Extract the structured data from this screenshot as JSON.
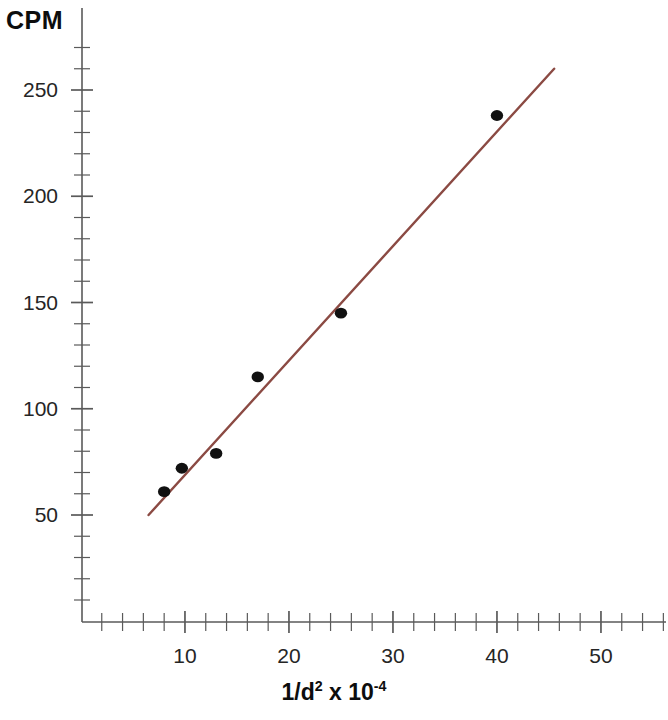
{
  "chart_data": {
    "type": "scatter",
    "title": "",
    "xlabel": "1/d² x 10⁻⁴",
    "ylabel": "CPM",
    "xlim": [
      0,
      57
    ],
    "ylim": [
      0,
      280
    ],
    "grid": false,
    "legend": null,
    "x": [
      8,
      9.7,
      13,
      17,
      25,
      40
    ],
    "y": [
      61,
      72,
      79,
      115,
      145,
      238
    ],
    "points": [
      {
        "x": 8,
        "y": 61
      },
      {
        "x": 9.7,
        "y": 72
      },
      {
        "x": 13,
        "y": 79
      },
      {
        "x": 17,
        "y": 115
      },
      {
        "x": 25,
        "y": 145
      },
      {
        "x": 40,
        "y": 238
      }
    ],
    "series": [
      {
        "name": "CPM measurements",
        "type": "scatter",
        "marker_color": "#111111",
        "values": [
          61,
          72,
          79,
          115,
          145,
          238
        ]
      },
      {
        "name": "linear fit",
        "type": "line",
        "line_color": "#8b4a43",
        "x_start": 6.5,
        "y_start": 50,
        "x_end": 45.5,
        "y_end": 260
      }
    ],
    "x_tick_labels": [
      "10",
      "20",
      "30",
      "40",
      "50"
    ],
    "x_tick_values": [
      10,
      20,
      30,
      40,
      50
    ],
    "x_minor_tick_step": 2,
    "y_tick_labels": [
      "50",
      "100",
      "150",
      "200",
      "250"
    ],
    "y_tick_values": [
      50,
      100,
      150,
      200,
      250
    ],
    "y_minor_tick_step": 10,
    "axis_color": "#5a5a5a",
    "marker_color": "#111111",
    "line_color": "#8b4a43",
    "background": "#ffffff"
  },
  "labels": {
    "y_axis_title": "CPM",
    "x_axis_title_main": "1/d",
    "x_axis_title_exp": "2",
    "x_axis_title_mid": " x 10",
    "x_axis_title_exp2": "-4"
  }
}
